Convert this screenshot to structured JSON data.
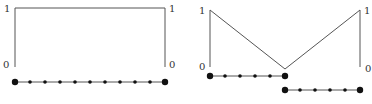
{
  "diagram": {
    "left_panel": {
      "labels": {
        "top_left": "1",
        "top_right": "1",
        "bottom_left": "0",
        "bottom_right": "0"
      },
      "function_shape": "constant",
      "path": [
        [
          15,
          67
        ],
        [
          15,
          8
        ],
        [
          165,
          8
        ],
        [
          165,
          67
        ]
      ],
      "dot_rows": [
        {
          "y": 82,
          "x_start": 15,
          "x_end": 165,
          "count": 11
        }
      ]
    },
    "right_panel": {
      "labels": {
        "top_left": "1",
        "top_right": "1",
        "bottom_left": "0",
        "bottom_right": "0"
      },
      "function_shape": "v-shape",
      "path": [
        [
          210,
          67
        ],
        [
          210,
          10
        ],
        [
          285,
          69
        ],
        [
          360,
          10
        ],
        [
          360,
          67
        ]
      ],
      "dot_rows": [
        {
          "y": 76,
          "x_start": 210,
          "x_end": 285,
          "count": 6
        },
        {
          "y": 90,
          "x_start": 285,
          "x_end": 360,
          "count": 6
        }
      ]
    },
    "colors": {
      "line": "#555555",
      "dot": "#111111",
      "text": "#333333"
    }
  }
}
